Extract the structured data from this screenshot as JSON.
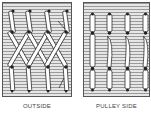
{
  "figure": {
    "panels": [
      {
        "id": "outside",
        "label": "OUTSIDE",
        "lacing": "criss-cross",
        "columns": 4
      },
      {
        "id": "pulley_side",
        "label": "PULLEY SIDE",
        "lacing": "straight",
        "columns": 4
      }
    ],
    "colors": {
      "background_lines": "#9a9a9a",
      "lace": "#ffffff",
      "outline": "#333333"
    }
  }
}
